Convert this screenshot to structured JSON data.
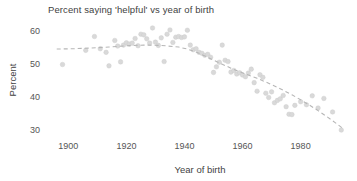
{
  "chart_data": {
    "type": "scatter",
    "title": "Percent saying 'helpful' vs year of birth",
    "xlabel": "Year of birth",
    "ylabel": "Percent",
    "xlim": [
      1893,
      1997
    ],
    "ylim": [
      28,
      62
    ],
    "xticks": [
      1900,
      1920,
      1940,
      1960,
      1980
    ],
    "yticks": [
      30,
      40,
      50,
      60
    ],
    "grid": false,
    "legend": false,
    "marker_color": "#d9d9d9",
    "trend_color": "#b6b6b6",
    "text_color": "#404040",
    "background_color": "#ffffff",
    "series": [
      {
        "name": "Percent saying 'helpful'",
        "x": [
          1898,
          1906,
          1909,
          1911,
          1913,
          1914,
          1916,
          1917,
          1918,
          1919,
          1920,
          1921,
          1922,
          1923,
          1924,
          1925,
          1926,
          1927,
          1928,
          1929,
          1930,
          1931,
          1932,
          1933,
          1934,
          1935,
          1936,
          1937,
          1938,
          1939,
          1940,
          1941,
          1942,
          1943,
          1944,
          1945,
          1946,
          1947,
          1948,
          1949,
          1950,
          1951,
          1952,
          1953,
          1954,
          1955,
          1956,
          1957,
          1958,
          1959,
          1960,
          1961,
          1962,
          1963,
          1964,
          1965,
          1966,
          1967,
          1968,
          1969,
          1970,
          1971,
          1972,
          1973,
          1974,
          1975,
          1976,
          1977,
          1978,
          1980,
          1982,
          1984,
          1986,
          1988,
          1991,
          1994
        ],
        "y": [
          49.7,
          54.0,
          58.2,
          54.5,
          53.4,
          49.3,
          57.0,
          55.3,
          50.5,
          55.6,
          56.3,
          55.9,
          56.2,
          57.6,
          55.4,
          58.9,
          58.7,
          57.5,
          56.2,
          60.8,
          56.5,
          55.5,
          57.8,
          50.6,
          58.9,
          60.2,
          56.4,
          58.0,
          58.2,
          57.9,
          58.1,
          60.1,
          55.6,
          54.2,
          54.5,
          53.4,
          53.1,
          52.5,
          52.8,
          51.9,
          47.3,
          49.0,
          50.4,
          55.6,
          51.0,
          50.6,
          47.4,
          47.9,
          46.8,
          47.2,
          46.5,
          46.0,
          47.1,
          48.3,
          44.2,
          41.6,
          46.6,
          45.8,
          41.0,
          39.7,
          41.4,
          38.1,
          38.8,
          39.3,
          40.3,
          36.9,
          34.6,
          34.5,
          37.3,
          38.4,
          37.5,
          40.2,
          36.5,
          39.4,
          35.3,
          29.8
        ],
        "marker": "circle"
      }
    ],
    "trend": {
      "name": "smoothed trend (LOESS)",
      "style": "dashed",
      "x": [
        1896,
        1902,
        1908,
        1914,
        1920,
        1926,
        1932,
        1938,
        1941,
        1944,
        1947,
        1950,
        1953,
        1956,
        1959,
        1962,
        1965,
        1968,
        1971,
        1974,
        1977,
        1980,
        1983,
        1986,
        1989,
        1992,
        1995
      ],
      "y": [
        54.4,
        54.5,
        54.7,
        55.0,
        55.4,
        55.6,
        55.5,
        55.0,
        54.4,
        53.5,
        52.3,
        51.0,
        49.8,
        48.6,
        47.5,
        46.5,
        45.5,
        44.4,
        43.2,
        41.9,
        40.5,
        39.0,
        37.4,
        35.7,
        33.9,
        32.0,
        30.0
      ]
    }
  }
}
